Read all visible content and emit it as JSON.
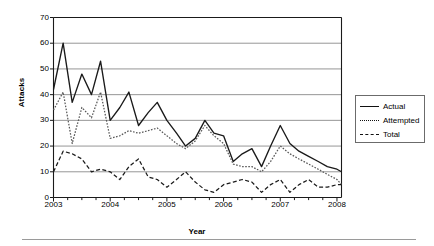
{
  "chart_data": {
    "type": "line",
    "title": "",
    "xlabel": "Year",
    "ylabel": "Attacks",
    "xlim": [
      2003.0,
      2008.08
    ],
    "ylim": [
      0,
      70
    ],
    "ytick_labels": [
      "0",
      "10",
      "20",
      "30",
      "40",
      "50",
      "60",
      "70"
    ],
    "ytick_values": [
      0,
      10,
      20,
      30,
      40,
      50,
      60,
      70
    ],
    "xtick_labels": [
      "2003",
      "2004",
      "2005",
      "2006",
      "2007",
      "2008"
    ],
    "xtick_values": [
      2003,
      2004,
      2005,
      2006,
      2007,
      2008
    ],
    "grid": "horizontal",
    "legend_position": "right-outside",
    "x": [
      2003.0,
      2003.17,
      2003.33,
      2003.5,
      2003.67,
      2003.83,
      2004.0,
      2004.17,
      2004.33,
      2004.5,
      2004.67,
      2004.83,
      2005.0,
      2005.17,
      2005.33,
      2005.5,
      2005.67,
      2005.83,
      2006.0,
      2006.17,
      2006.33,
      2006.5,
      2006.67,
      2006.83,
      2007.0,
      2007.17,
      2007.33,
      2007.5,
      2007.67,
      2007.83,
      2008.0,
      2008.08
    ],
    "series": [
      {
        "name": "Actual",
        "style": "solid",
        "color": "#1a1a1a",
        "values": [
          42,
          60,
          37,
          48,
          40,
          53,
          30,
          35,
          41,
          28,
          33,
          37,
          30,
          25,
          20,
          23,
          30,
          25,
          24,
          14,
          17,
          19,
          12,
          20,
          28,
          21,
          18,
          16,
          14,
          12,
          11,
          10
        ]
      },
      {
        "name": "Attempted",
        "style": "dotted",
        "color": "#585858",
        "values": [
          34,
          41,
          21,
          35,
          31,
          41,
          23,
          24,
          26,
          25,
          26,
          27,
          24,
          21,
          19,
          22,
          28,
          24,
          21,
          13,
          12,
          12,
          10,
          14,
          20,
          17,
          15,
          13,
          11,
          9,
          7,
          5
        ]
      },
      {
        "name": "Total",
        "style": "dashed",
        "color": "#1a1a1a",
        "values": [
          10,
          18,
          17,
          15,
          10,
          11,
          10,
          7,
          12,
          15,
          8,
          7,
          4,
          7,
          10,
          6,
          3,
          2,
          5,
          6,
          7,
          6,
          2,
          5,
          7,
          2,
          5,
          7,
          4,
          4,
          5,
          5
        ]
      }
    ]
  },
  "legend": {
    "entries": [
      {
        "label": "Actual"
      },
      {
        "label": "Attempted"
      },
      {
        "label": "Total"
      }
    ]
  }
}
